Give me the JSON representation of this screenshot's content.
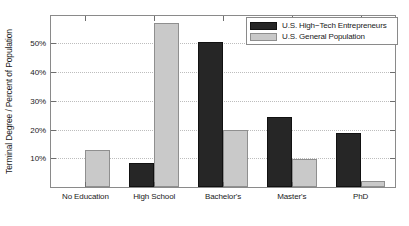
{
  "chart_data": {
    "type": "bar",
    "title": "",
    "xlabel": "",
    "ylabel": "Terminal Degree / Percent of Population",
    "categories": [
      "No Education",
      "High School",
      "Bachelor's",
      "Master's",
      "PhD"
    ],
    "series": [
      {
        "name": "U.S. High−Tech Entrepreneurs",
        "color": "#262626",
        "values": [
          0,
          8.2,
          50.5,
          24.3,
          18.7
        ]
      },
      {
        "name": "U.S. General Population",
        "color": "#c9c9c9",
        "values": [
          13.0,
          57.0,
          19.7,
          9.6,
          2.0
        ]
      }
    ],
    "ylim": [
      0,
      59.5
    ],
    "yticks": [
      10,
      20,
      30,
      40,
      50
    ],
    "ytick_labels": [
      "10%",
      "20%",
      "30%",
      "40%",
      "50%"
    ],
    "grid": true,
    "grid_axis": "y",
    "legend_position": "top-right"
  },
  "legend": {
    "entries": [
      {
        "label": "U.S. High−Tech Entrepreneurs",
        "swatch": "dark"
      },
      {
        "label": "U.S. General Population",
        "swatch": "light"
      }
    ]
  },
  "axis": {
    "y_title": "Terminal Degree / Percent of Population"
  }
}
